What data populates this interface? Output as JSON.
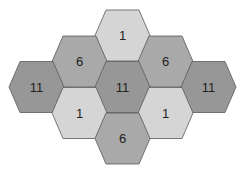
{
  "diagram": {
    "type": "hexagon-grid",
    "colors": {
      "1": "#d5d5d5",
      "6": "#a9a9a9",
      "11": "#979797",
      "stroke": "#5a5a5a"
    },
    "cells": [
      {
        "label": "1",
        "cx": 122.5,
        "cy": 35.5,
        "level": "1"
      },
      {
        "label": "6",
        "cx": 79.5,
        "cy": 61.5,
        "level": "6"
      },
      {
        "label": "6",
        "cx": 165.5,
        "cy": 61.5,
        "level": "6"
      },
      {
        "label": "11",
        "cx": 36.5,
        "cy": 87,
        "level": "11"
      },
      {
        "label": "11",
        "cx": 122.5,
        "cy": 87,
        "level": "11"
      },
      {
        "label": "11",
        "cx": 208.5,
        "cy": 87,
        "level": "11"
      },
      {
        "label": "1",
        "cx": 79.5,
        "cy": 113,
        "level": "1"
      },
      {
        "label": "1",
        "cx": 165.5,
        "cy": 113,
        "level": "1"
      },
      {
        "label": "6",
        "cx": 122.5,
        "cy": 138.5,
        "level": "6"
      }
    ]
  }
}
